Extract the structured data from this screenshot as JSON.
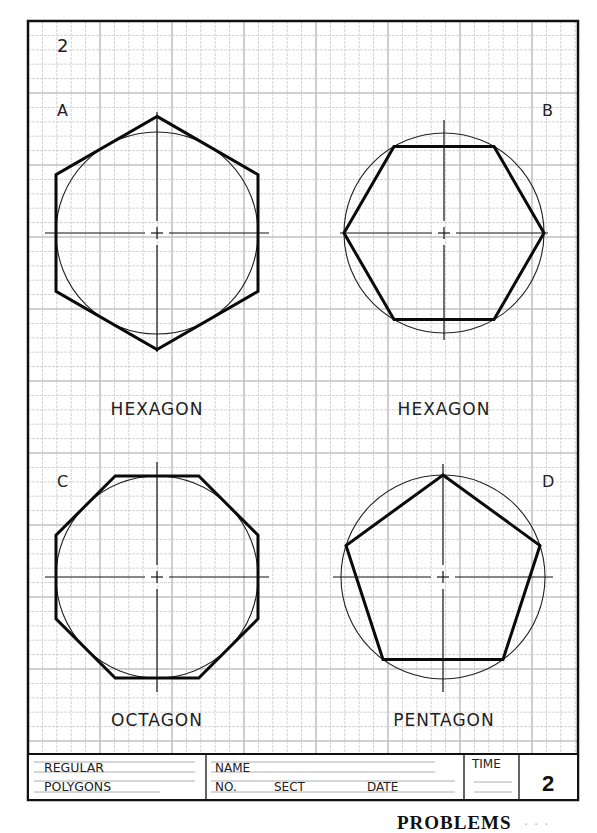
{
  "sheet": {
    "sheet_number": "2",
    "grid": {
      "origin_x": 28,
      "origin_y": 21,
      "spacing": 14.4,
      "major_every": 5,
      "minor_color": "#d4d4d4",
      "major_color": "#c2c2c2"
    },
    "border": {
      "x": 28,
      "y": 21,
      "width": 550,
      "height": 779,
      "color": "#111111"
    }
  },
  "figures": [
    {
      "letter": "A",
      "name": "HEXAGON",
      "shape": "hexagon",
      "construction": "circumscribed (circle inscribed in polygon, flats vertical)",
      "center": [
        157,
        233
      ],
      "circle_radius": 101
    },
    {
      "letter": "B",
      "name": "HEXAGON",
      "shape": "hexagon",
      "construction": "inscribed (polygon inscribed in circle, flats horizontal)",
      "center": [
        444,
        233
      ],
      "circle_radius": 100
    },
    {
      "letter": "C",
      "name": "OCTAGON",
      "shape": "octagon",
      "construction": "circumscribed (circle inscribed in polygon)",
      "center": [
        157,
        577
      ],
      "circle_radius": 101
    },
    {
      "letter": "D",
      "name": "PENTAGON",
      "shape": "pentagon",
      "construction": "inscribed (polygon inscribed in circle, apex up)",
      "center": [
        443,
        577
      ],
      "circle_radius": 102
    }
  ],
  "title_block": {
    "title_line1": "REGULAR",
    "title_line2": "POLYGONS",
    "name_label": "NAME",
    "no_label": "NO.",
    "sect_label": "SECT",
    "date_label": "DATE",
    "time_label": "TIME",
    "sheet_number": "2"
  },
  "footer": {
    "text": "PROBLEMS",
    "page_hint": "· · ·"
  }
}
